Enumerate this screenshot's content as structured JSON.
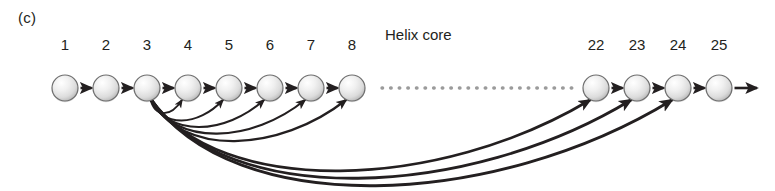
{
  "figure": {
    "panel_letter": "(c)",
    "core_label": "Helix core",
    "colors": {
      "text": "#231f20",
      "node_fill_light": "#ffffff",
      "node_fill_mid": "#e3e3e3",
      "node_fill_dark": "#b9b9b9",
      "node_stroke": "#6e6e6e",
      "arrow": "#231f20",
      "dotted": "#9b9b9b"
    },
    "geometry": {
      "width": 775,
      "height": 191,
      "chain_y": 88,
      "node_radius": 13,
      "label_y": 36,
      "core_label_x": 385,
      "core_label_y": 26,
      "dotted_start_x": 382,
      "dotted_end_x": 575,
      "tail_arrow_end_x": 757
    },
    "nodes": [
      {
        "id": "1",
        "label": "1",
        "x": 65,
        "has_label": true
      },
      {
        "id": "2",
        "label": "2",
        "x": 106,
        "has_label": true
      },
      {
        "id": "3",
        "label": "3",
        "x": 147,
        "has_label": true
      },
      {
        "id": "4",
        "label": "4",
        "x": 188,
        "has_label": true
      },
      {
        "id": "5",
        "label": "5",
        "x": 229,
        "has_label": true
      },
      {
        "id": "6",
        "label": "6",
        "x": 270,
        "has_label": true
      },
      {
        "id": "7",
        "label": "7",
        "x": 311,
        "has_label": true
      },
      {
        "id": "8",
        "label": "8",
        "x": 352,
        "has_label": true
      },
      {
        "id": "22",
        "label": "22",
        "x": 596,
        "has_label": true
      },
      {
        "id": "23",
        "label": "23",
        "x": 637,
        "has_label": true
      },
      {
        "id": "24",
        "label": "24",
        "x": 678,
        "has_label": true
      },
      {
        "id": "25",
        "label": "25",
        "x": 719,
        "has_label": true
      }
    ],
    "backbone_arrows": [
      {
        "from": "1",
        "to": "2"
      },
      {
        "from": "2",
        "to": "3"
      },
      {
        "from": "3",
        "to": "4"
      },
      {
        "from": "4",
        "to": "5"
      },
      {
        "from": "5",
        "to": "6"
      },
      {
        "from": "6",
        "to": "7"
      },
      {
        "from": "7",
        "to": "8"
      },
      {
        "from": "22",
        "to": "23"
      },
      {
        "from": "23",
        "to": "24"
      },
      {
        "from": "24",
        "to": "25"
      }
    ],
    "contact_arcs": [
      {
        "from": "3",
        "to": "4",
        "depth": 16
      },
      {
        "from": "3",
        "to": "5",
        "depth": 24
      },
      {
        "from": "3",
        "to": "6",
        "depth": 31
      },
      {
        "from": "3",
        "to": "7",
        "depth": 38
      },
      {
        "from": "3",
        "to": "8",
        "depth": 46
      },
      {
        "from": "3",
        "to": "22",
        "depth": 78
      },
      {
        "from": "3",
        "to": "23",
        "depth": 86
      },
      {
        "from": "3",
        "to": "24",
        "depth": 94
      }
    ]
  }
}
